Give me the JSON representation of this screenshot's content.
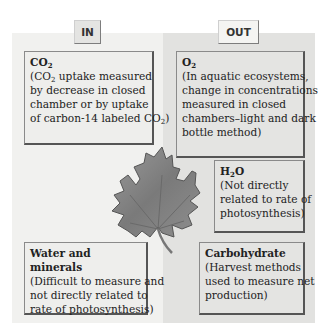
{
  "diagram": {
    "columns": {
      "in": {
        "label": "IN",
        "background": "#f1f1ef"
      },
      "out": {
        "label": "OUT",
        "background": "#e2e2e0"
      }
    },
    "center_icon": "maple-leaf-icon",
    "boxes": {
      "co2": {
        "column": "in",
        "title_main": "CO",
        "title_sub": "2",
        "lines": [
          "(CO|2| uptake measured",
          "by decrease in closed",
          "chamber or by uptake",
          "of carbon-14 labeled CO|2|)"
        ],
        "line1_pre": "(CO",
        "line1_sub": "2",
        "line1_post": " uptake measured",
        "line2": "by decrease in closed",
        "line3": "chamber or by uptake",
        "line4_pre": "of carbon-14 labeled CO",
        "line4_sub": "2",
        "line4_post": ")"
      },
      "o2": {
        "column": "out",
        "title_main": "O",
        "title_sub": "2",
        "line1": "(In aquatic ecosystems,",
        "line2": "change in concentrations",
        "line3": "measured in closed",
        "line4": "chambers–light and dark",
        "line5": "bottle method)"
      },
      "h2o": {
        "column": "out",
        "title_pre": "H",
        "title_sub": "2",
        "title_post": "O",
        "line1": "(Not directly",
        "line2": "related to rate of",
        "line3": "photosynthesis)"
      },
      "water": {
        "column": "in",
        "title": "Water and minerals",
        "line1": "(Difficult to measure and",
        "line2": "not directly related to",
        "line3": "rate of photosynthesis)"
      },
      "carbohydrate": {
        "column": "out",
        "title": "Carbohydrate",
        "line1": "(Harvest methods",
        "line2": "used to measure net",
        "line3": "production)"
      }
    }
  }
}
